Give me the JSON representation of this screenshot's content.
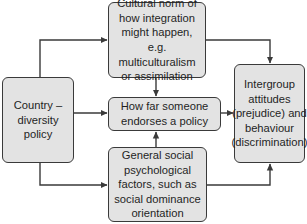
{
  "diagram": {
    "type": "flow-diagram",
    "colors": {
      "box_fill": "#e3e3e3",
      "box_border": "#3a3a3a",
      "arrow": "#3a3a3a",
      "text": "#1f1f1f"
    },
    "nodes": {
      "country": {
        "label": "Country – diversity policy"
      },
      "cultural_norm": {
        "label": "Cultural norm of how integration might happen, e.g. multiculturalism or assimilation"
      },
      "endorsement": {
        "label": "How far someone endorses a policy"
      },
      "social_factors": {
        "label": "General social psychological factors, such as social dominance orientation"
      },
      "intergroup": {
        "label": "Intergroup attitudes (prejudice) and behaviour (discrimination)"
      }
    },
    "edges": [
      {
        "from": "country",
        "to": "cultural_norm"
      },
      {
        "from": "country",
        "to": "endorsement"
      },
      {
        "from": "country",
        "to": "social_factors"
      },
      {
        "from": "cultural_norm",
        "to": "endorsement"
      },
      {
        "from": "social_factors",
        "to": "endorsement"
      },
      {
        "from": "cultural_norm",
        "to": "intergroup"
      },
      {
        "from": "endorsement",
        "to": "intergroup"
      },
      {
        "from": "social_factors",
        "to": "intergroup"
      }
    ]
  }
}
